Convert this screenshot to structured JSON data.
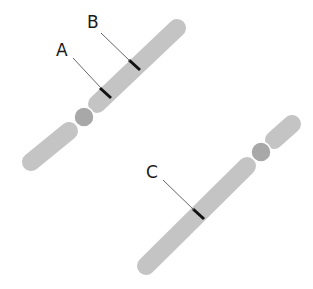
{
  "diagram": {
    "type": "chromosome-pair",
    "colors": {
      "arm": "#c4c4c4",
      "centromere": "#a8a8a8",
      "band": "#111111",
      "leader": "#555555",
      "background": "#ffffff"
    },
    "chromosomes": [
      {
        "id": "chromosome-1",
        "bands": [
          {
            "label": "A"
          },
          {
            "label": "B"
          }
        ]
      },
      {
        "id": "chromosome-2",
        "bands": [
          {
            "label": "C"
          }
        ]
      }
    ]
  }
}
